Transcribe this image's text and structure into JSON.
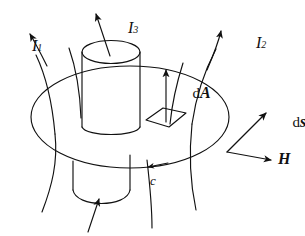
{
  "figure": {
    "background_color": "#ffffff",
    "ink_color": "#111111",
    "width": 305,
    "height": 236
  },
  "labels": {
    "current_1": {
      "symbol": "I",
      "subscript": "1",
      "text": "I₁"
    },
    "current_2": {
      "symbol": "I",
      "subscript": "2",
      "text": "I₂"
    },
    "current_3": {
      "symbol": "I",
      "subscript": "3",
      "text": "I₃"
    },
    "area_element": {
      "prefix": "d",
      "vector": "A",
      "text": "dA"
    },
    "path_element": {
      "prefix": "d",
      "vector": "s",
      "text": "ds"
    },
    "field_vector": {
      "text": "H"
    },
    "contour": {
      "text": "c"
    }
  },
  "icons": {
    "arrow_i1": "arrowhead-icon",
    "arrow_i2": "arrowhead-icon",
    "arrow_i3": "arrowhead-icon",
    "arrow_da": "arrowhead-icon",
    "arrow_ds": "arrowhead-icon",
    "arrow_h": "arrowhead-icon",
    "arrow_c": "arrowhead-icon",
    "arrow_bottom": "arrowhead-icon"
  },
  "shapes": {
    "surface_disk": "ellipse-surface",
    "upper_cylinder": "cylinder-conductor-upper",
    "lower_cylinder": "cylinder-conductor-lower",
    "area_patch": "parallelogram-area-element",
    "field_line_left": "curved-field-line",
    "field_line_right": "curved-field-line",
    "field_line_center": "curved-field-line"
  }
}
